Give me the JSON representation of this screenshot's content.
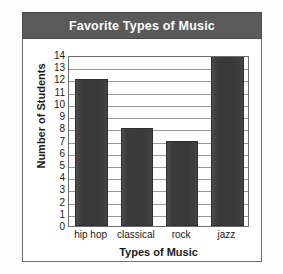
{
  "chart_data": {
    "type": "bar",
    "title": "Favorite Types of Music",
    "xlabel": "Types of Music",
    "ylabel": "Number of Students",
    "categories": [
      "hip hop",
      "classical",
      "rock",
      "jazz"
    ],
    "values": [
      12,
      8,
      7,
      14
    ],
    "ylim": [
      0,
      14
    ],
    "ytick_step": 1,
    "yticks": [
      14,
      13,
      12,
      11,
      10,
      9,
      8,
      7,
      6,
      5,
      4,
      3,
      2,
      1,
      0
    ],
    "grid": "horizontal",
    "legend": "none",
    "colors": {
      "bar_fill": "#3b3b3b",
      "title_banner": "#5a5a5a",
      "title_text": "#ffffff",
      "gridline": "#9a9a9a",
      "frame": "#6d6d6d",
      "plot_background": "#ffffff",
      "text": "#1a1a1a"
    }
  }
}
